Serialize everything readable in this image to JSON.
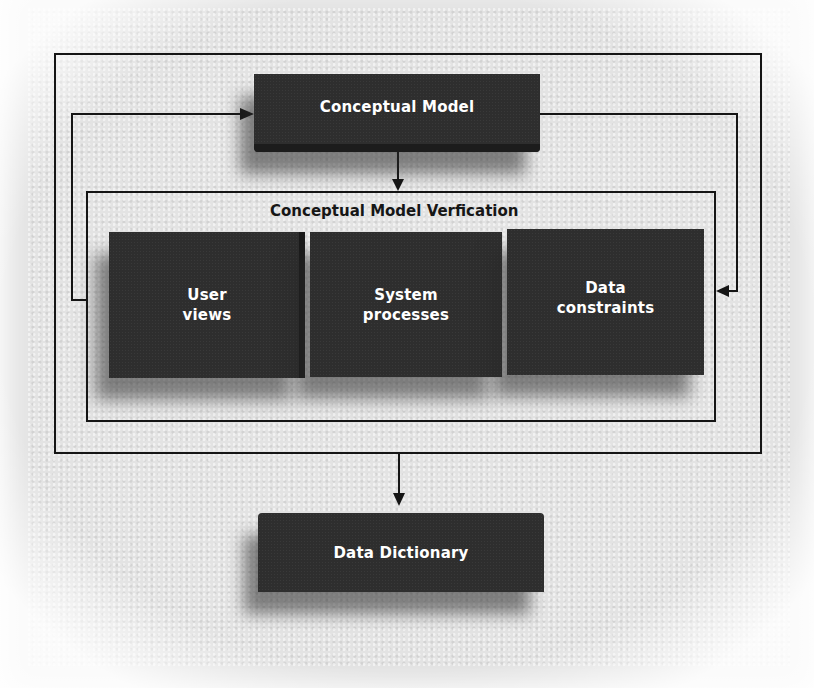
{
  "diagram": {
    "top_node": {
      "label": "Conceptual Model"
    },
    "verification_group": {
      "title": "Conceptual Model Verfication",
      "nodes": [
        {
          "label": "User\nviews"
        },
        {
          "label": "System\nprocesses"
        },
        {
          "label": "Data\nconstraints"
        }
      ]
    },
    "bottom_node": {
      "label": "Data Dictionary"
    },
    "edges": [
      {
        "from": "Conceptual Model",
        "to": "Conceptual Model Verfication"
      },
      {
        "from": "Conceptual Model Verfication",
        "to": "Conceptual Model",
        "route": "left feedback loop"
      },
      {
        "from": "Conceptual Model",
        "to": "Conceptual Model Verfication",
        "route": "right loop"
      },
      {
        "from": "Outer process",
        "to": "Data Dictionary"
      }
    ]
  },
  "colors": {
    "box_fill": "#2e2e2e",
    "line": "#151515",
    "paper": "#e3e3e3",
    "text_on_box": "#ffffff"
  }
}
